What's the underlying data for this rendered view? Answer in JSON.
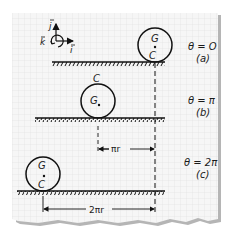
{
  "figure": {
    "paper": {
      "background": "#f6f6f6",
      "grid_color": "#dcdcdc",
      "shadow": "#9a9a9a"
    },
    "ink_color": "#111111",
    "axes": {
      "j_label": "j",
      "i_label": "i",
      "k_label": "k"
    },
    "states": [
      {
        "id": "a",
        "theta_label": "θ = O",
        "case_label": "(a)",
        "top_point": "G",
        "bottom_point": "C"
      },
      {
        "id": "b",
        "theta_label": "θ = π",
        "case_label": "(b)",
        "top_point": "C",
        "center_point": "G"
      },
      {
        "id": "c",
        "theta_label": "θ = 2π",
        "case_label": "(c)",
        "top_point": "G",
        "bottom_point": "C"
      }
    ],
    "dimensions": {
      "half_turn": "πr",
      "full_turn": "2πr"
    }
  }
}
